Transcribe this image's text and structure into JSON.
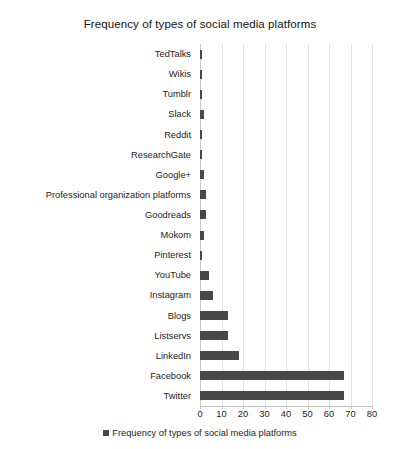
{
  "chart_data": {
    "type": "bar",
    "orientation": "horizontal",
    "title": "Frequency of types of social media platforms",
    "xlabel": "",
    "ylabel": "",
    "xlim": [
      0,
      80
    ],
    "xticks": [
      0,
      10,
      20,
      30,
      40,
      50,
      60,
      70,
      80
    ],
    "grid": true,
    "legend_position": "bottom",
    "series": [
      {
        "name": "Frequency of types of social media platforms",
        "color": "#484848",
        "values": [
          1,
          1,
          1,
          2,
          1,
          1,
          2,
          3,
          3,
          2,
          1,
          4,
          6,
          13,
          13,
          18,
          67,
          67
        ]
      }
    ],
    "categories": [
      "TedTalks",
      "Wikis",
      "Tumblr",
      "Slack",
      "Reddit",
      "ResearchGate",
      "Google+",
      "Professional organization platforms",
      "Goodreads",
      "Mokom",
      "Pinterest",
      "YouTube",
      "Instagram",
      "Blogs",
      "Listservs",
      "LinkedIn",
      "Facebook",
      "Twitter"
    ]
  },
  "legend": {
    "entries": [
      {
        "label": "Frequency of types of social media platforms",
        "color": "#484848"
      }
    ]
  },
  "colors": {
    "bar": "#484848",
    "gridline": "#e3e3e3",
    "axis": "#bfbfbf",
    "text": "#1c1c1c",
    "background": "#ffffff"
  }
}
